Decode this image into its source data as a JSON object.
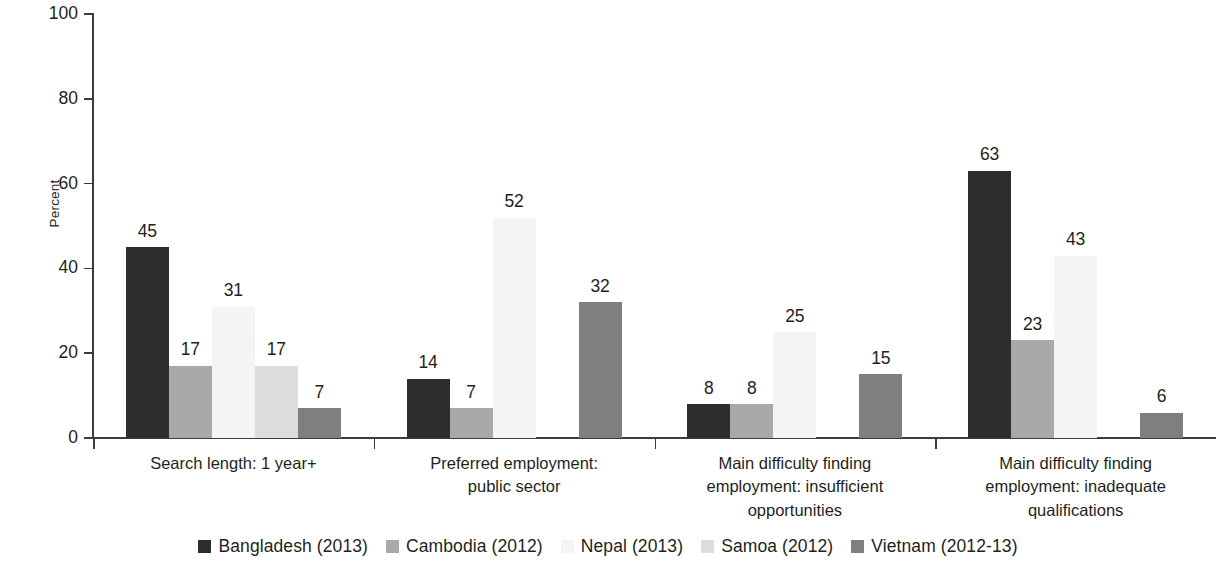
{
  "axis": {
    "ylabel": "Percent",
    "yticks": [
      "0",
      "20",
      "40",
      "60",
      "80",
      "100"
    ]
  },
  "legend": {
    "items": [
      {
        "label": "Bangladesh (2013)",
        "color": "#2d2d2d",
        "swatch": "legend-swatch-bangladesh"
      },
      {
        "label": "Cambodia (2012)",
        "color": "#a9a9a9",
        "swatch": "legend-swatch-cambodia"
      },
      {
        "label": "Nepal (2013)",
        "color": "#f4f4f4",
        "swatch": "legend-swatch-nepal"
      },
      {
        "label": "Samoa (2012)",
        "color": "#dddddd",
        "swatch": "legend-swatch-samoa"
      },
      {
        "label": "Vietnam (2012-13)",
        "color": "#7f7f7f",
        "swatch": "legend-swatch-vietnam"
      }
    ]
  },
  "categories": [
    {
      "lines": [
        "Search length: 1 year+"
      ]
    },
    {
      "lines": [
        "Preferred employment:",
        "public sector"
      ]
    },
    {
      "lines": [
        "Main difficulty finding",
        "employment: insufficient",
        "opportunities"
      ]
    },
    {
      "lines": [
        "Main difficulty finding",
        "employment: inadequate",
        "qualifications"
      ]
    }
  ],
  "chart_data": {
    "type": "bar",
    "title": "",
    "subtitle": "",
    "xlabel": "",
    "ylabel": "Percent",
    "ylim": [
      0,
      100
    ],
    "yticks": [
      0,
      20,
      40,
      60,
      80,
      100
    ],
    "grid": false,
    "legend_position": "bottom",
    "grouped": true,
    "categories": [
      "Search length: 1 year+",
      "Preferred employment: public sector",
      "Main difficulty finding employment: insufficient opportunities",
      "Main difficulty finding employment: inadequate qualifications"
    ],
    "series": [
      {
        "name": "Bangladesh (2013)",
        "color": "#2d2d2d",
        "values": [
          45,
          14,
          8,
          63
        ]
      },
      {
        "name": "Cambodia (2012)",
        "color": "#a9a9a9",
        "values": [
          17,
          7,
          8,
          23
        ]
      },
      {
        "name": "Nepal (2013)",
        "color": "#f4f4f4",
        "values": [
          31,
          52,
          25,
          43
        ]
      },
      {
        "name": "Samoa (2012)",
        "color": "#dddddd",
        "values": [
          17,
          null,
          null,
          null
        ]
      },
      {
        "name": "Vietnam (2012-13)",
        "color": "#7f7f7f",
        "values": [
          7,
          32,
          15,
          6
        ]
      }
    ],
    "value_labels": [
      [
        "45",
        "17",
        "31",
        "17",
        "7"
      ],
      [
        "14",
        "7",
        "52",
        "",
        "32"
      ],
      [
        "8",
        "8",
        "25",
        "",
        "15"
      ],
      [
        "63",
        "23",
        "43",
        "",
        "6"
      ]
    ]
  }
}
